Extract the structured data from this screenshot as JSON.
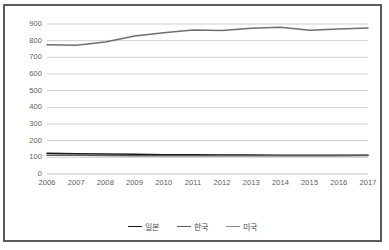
{
  "chart_data": {
    "type": "line",
    "title": "",
    "subtitle": "",
    "xlabel": "",
    "ylabel": "",
    "categories": [
      "2006",
      "2007",
      "2008",
      "2009",
      "2010",
      "2011",
      "2012",
      "2013",
      "2014",
      "2015",
      "2016",
      "2017"
    ],
    "x": [
      2006,
      2007,
      2008,
      2009,
      2010,
      2011,
      2012,
      2013,
      2014,
      2015,
      2016,
      2017
    ],
    "ylim": [
      0,
      900
    ],
    "xlim": [
      2006,
      2017
    ],
    "yticks": [
      0,
      100,
      200,
      300,
      400,
      500,
      600,
      700,
      800,
      900
    ],
    "ytick_labels": [
      "0",
      "100",
      "200",
      "300",
      "400",
      "500",
      "600",
      "700",
      "800",
      "900"
    ],
    "grid": true,
    "grid_axis": "y",
    "legend_position": "bottom",
    "series": [
      {
        "name": "일본",
        "color": "#1a1a1a",
        "values": [
          125,
          122,
          120,
          118,
          116,
          115,
          114,
          114,
          113,
          113,
          113,
          113
        ]
      },
      {
        "name": "한국",
        "color": "#5c5c5c",
        "values": [
          113,
          112,
          111,
          110,
          110,
          109,
          109,
          109,
          109,
          109,
          110,
          111
        ]
      },
      {
        "name": "미국",
        "color": "#6e6e6e",
        "values": [
          775,
          772,
          792,
          828,
          848,
          864,
          861,
          874,
          880,
          862,
          870,
          876
        ]
      }
    ]
  },
  "legend": {
    "items": [
      {
        "label": "일본",
        "color": "#1a1a1a"
      },
      {
        "label": "한국",
        "color": "#5c5c5c"
      },
      {
        "label": "미국",
        "color": "#8a8a8a"
      }
    ]
  },
  "colors": {
    "frame_border": "#5a5a5a",
    "gridline": "#c9c9c9",
    "axis_text": "#5e5e5e",
    "background": "#ffffff"
  }
}
